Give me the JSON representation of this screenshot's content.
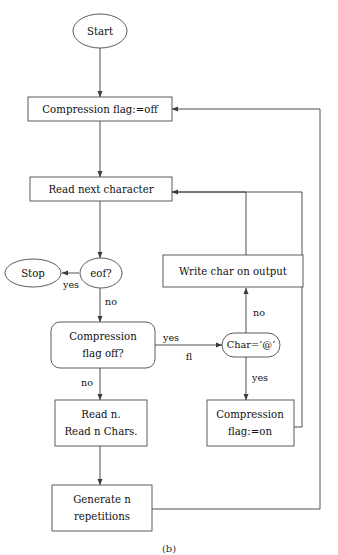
{
  "diagram": {
    "caption": "(b)",
    "stroke_color": "#3c3c3c",
    "node_fill": "#ffffff",
    "text_color": "#111111",
    "nodes": {
      "start": {
        "label": "Start",
        "shape": "ellipse"
      },
      "stop": {
        "label": "Stop",
        "shape": "ellipse"
      },
      "eof": {
        "label": "eof?",
        "shape": "ellipse"
      },
      "compression_flag_off_assign": {
        "label": "Compression flag:=off",
        "shape": "rect"
      },
      "read_next_character": {
        "label": "Read next character",
        "shape": "rect"
      },
      "compression_flag_off_test_line1": {
        "label": "Compression",
        "shape": "rounded-rect"
      },
      "compression_flag_off_test_line2": {
        "label": "flag off?",
        "shape": "rounded-rect"
      },
      "char_at": {
        "label": "Char=‘@’",
        "shape": "stadium"
      },
      "write_char_on_output": {
        "label": "Write char on output",
        "shape": "rect"
      },
      "compression_flag_on_line1": {
        "label": "Compression",
        "shape": "rect"
      },
      "compression_flag_on_line2": {
        "label": "flag:=on",
        "shape": "rect"
      },
      "read_n_line1": {
        "label": "Read n.",
        "shape": "rect"
      },
      "read_n_line2": {
        "label": "Read n Chars.",
        "shape": "rect"
      },
      "generate_n_line1": {
        "label": "Generate n",
        "shape": "rect"
      },
      "generate_n_line2": {
        "label": "repetitions",
        "shape": "rect"
      }
    },
    "edge_labels": {
      "eof_yes": "yes",
      "eof_no": "no",
      "flagtest_yes": "yes",
      "flagtest_fl": "fl",
      "flagtest_no": "no",
      "char_no": "no",
      "char_yes": "yes"
    }
  }
}
